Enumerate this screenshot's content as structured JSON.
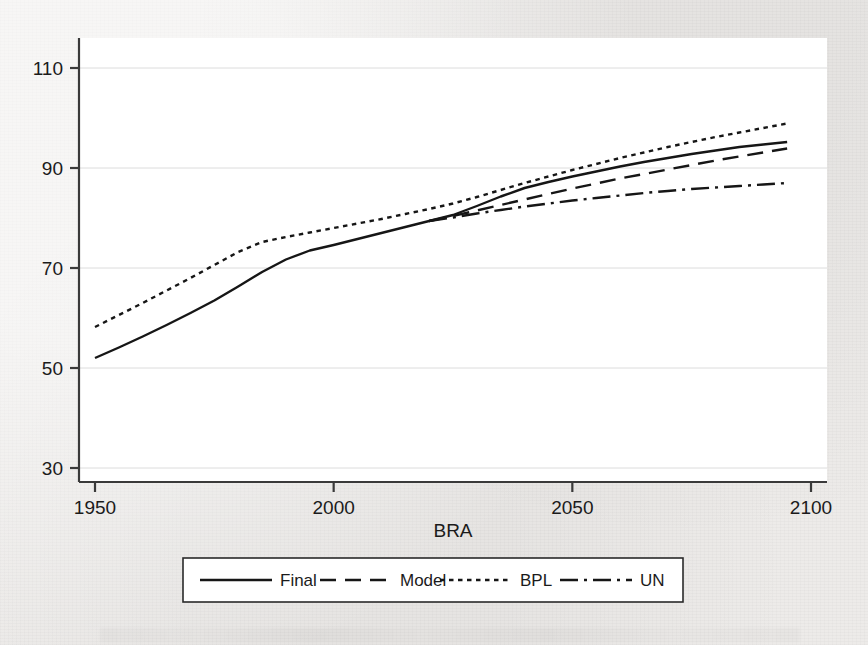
{
  "chart_data": {
    "type": "line",
    "title": "",
    "xlabel": "BRA",
    "ylabel": "",
    "xlim": [
      1946,
      2100
    ],
    "ylim": [
      30,
      112
    ],
    "xticks": [
      1950,
      2000,
      2050,
      2100
    ],
    "yticks": [
      30,
      50,
      70,
      90,
      110
    ],
    "xtick_labels": [
      "1950",
      "2000",
      "2050",
      "2100"
    ],
    "ytick_labels": [
      "30",
      "50",
      "70",
      "90",
      "110"
    ],
    "grid": "horizontal-only",
    "legend_position": "below-axis-boxed",
    "series": [
      {
        "name": "Final",
        "style": "solid",
        "x": [
          1950,
          1955,
          1960,
          1965,
          1970,
          1975,
          1980,
          1985,
          1990,
          1995,
          2000,
          2005,
          2010,
          2015,
          2020,
          2025,
          2030,
          2035,
          2040,
          2045,
          2050,
          2055,
          2060,
          2065,
          2070,
          2075,
          2080,
          2085,
          2090,
          2095
        ],
        "values": [
          52.0,
          54.1,
          56.3,
          58.6,
          61.0,
          63.5,
          66.3,
          69.2,
          71.7,
          73.5,
          74.6,
          75.8,
          77.0,
          78.2,
          79.4,
          80.6,
          82.4,
          84.3,
          86.0,
          87.2,
          88.3,
          89.3,
          90.3,
          91.2,
          92.0,
          92.8,
          93.5,
          94.2,
          94.7,
          95.2
        ]
      },
      {
        "name": "Model",
        "style": "dashed",
        "x": [
          2020,
          2025,
          2030,
          2035,
          2040,
          2045,
          2050,
          2055,
          2060,
          2065,
          2070,
          2075,
          2080,
          2085,
          2090,
          2095
        ],
        "values": [
          79.4,
          80.4,
          81.5,
          82.6,
          83.7,
          84.8,
          85.9,
          86.9,
          87.9,
          88.8,
          89.7,
          90.6,
          91.5,
          92.3,
          93.1,
          93.9
        ]
      },
      {
        "name": "BPL",
        "style": "dotted",
        "x": [
          1950,
          1955,
          1960,
          1965,
          1970,
          1975,
          1980,
          1985,
          1990,
          1995,
          2000,
          2005,
          2010,
          2015,
          2020,
          2025,
          2030,
          2035,
          2040,
          2045,
          2050,
          2055,
          2060,
          2065,
          2070,
          2075,
          2080,
          2085,
          2090,
          2095
        ],
        "values": [
          58.2,
          60.6,
          63.0,
          65.5,
          68.0,
          70.6,
          73.2,
          75.2,
          76.2,
          77.1,
          78.0,
          78.9,
          79.8,
          80.8,
          81.8,
          82.9,
          84.2,
          85.6,
          87.0,
          88.3,
          89.6,
          90.8,
          92.0,
          93.1,
          94.2,
          95.2,
          96.2,
          97.1,
          98.0,
          98.9
        ]
      },
      {
        "name": "UN",
        "style": "dash-dot",
        "x": [
          2020,
          2025,
          2030,
          2035,
          2040,
          2045,
          2050,
          2055,
          2060,
          2065,
          2070,
          2075,
          2080,
          2085,
          2090,
          2095
        ],
        "values": [
          79.4,
          80.1,
          80.9,
          81.6,
          82.3,
          82.9,
          83.5,
          84.0,
          84.5,
          85.0,
          85.4,
          85.8,
          86.1,
          86.4,
          86.7,
          87.0
        ]
      }
    ]
  },
  "legend": {
    "items": [
      {
        "label": "Final",
        "style": "solid"
      },
      {
        "label": "Model",
        "style": "dashed"
      },
      {
        "label": "BPL",
        "style": "dotted"
      },
      {
        "label": "UN",
        "style": "dash-dot"
      }
    ]
  },
  "colors": {
    "line": "#161616",
    "axis": "#3a3a3a",
    "grid": "#dcdcdc",
    "plot_background": "#ffffff",
    "page_background": "#edebe9",
    "text": "#1b1b1b"
  }
}
